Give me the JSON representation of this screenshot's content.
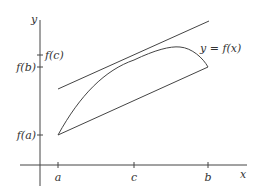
{
  "diagram": {
    "axes": {
      "x_label": "x",
      "y_label": "y"
    },
    "x_ticks": [
      {
        "label": "a",
        "x": 58
      },
      {
        "label": "c",
        "x": 134
      },
      {
        "label": "b",
        "x": 208
      }
    ],
    "y_ticks": [
      {
        "label": "f(c)",
        "y": 55
      },
      {
        "label": "f(b)",
        "y": 67
      },
      {
        "label": "f(a)",
        "y": 135
      }
    ],
    "curve_label": "y = f(x)",
    "elements": [
      {
        "name": "curve",
        "description": "y = f(x) from (a, f(a)) to (b, f(b))"
      },
      {
        "name": "secant-line",
        "description": "line through (a, f(a)) and (b, f(b))"
      },
      {
        "name": "tangent-line",
        "description": "tangent at x = c, parallel to secant"
      }
    ],
    "colors": {
      "stroke": "#444444",
      "text": "#333333",
      "background": "#ffffff"
    }
  }
}
